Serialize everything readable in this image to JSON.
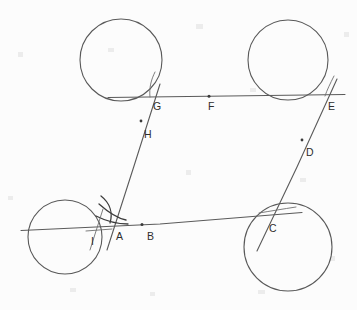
{
  "diagram": {
    "background_color": "#fcfcfc",
    "stroke_color": "#595959",
    "label_color": "#2e2e2e",
    "width": 357,
    "height": 310,
    "circles": [
      {
        "name": "circle-top-left",
        "cx": 121,
        "cy": 60,
        "r": 41
      },
      {
        "name": "circle-top-right",
        "cx": 288,
        "cy": 60,
        "r": 40
      },
      {
        "name": "circle-bottom-left",
        "cx": 65,
        "cy": 237,
        "r": 37
      },
      {
        "name": "circle-bottom-right",
        "cx": 288,
        "cy": 247,
        "r": 44
      }
    ],
    "points": [
      {
        "label": "A",
        "x": 118,
        "y": 235,
        "dot_x": 112,
        "dot_y": 224,
        "has_dot": false
      },
      {
        "label": "B",
        "x": 149,
        "y": 236,
        "dot_x": 142,
        "dot_y": 222,
        "has_dot": true
      },
      {
        "label": "C",
        "x": 272,
        "y": 228,
        "dot_x": 263,
        "dot_y": 212,
        "has_dot": false
      },
      {
        "label": "D",
        "x": 307,
        "y": 152,
        "dot_x": 301,
        "dot_y": 142,
        "has_dot": true
      },
      {
        "label": "E",
        "x": 330,
        "y": 107,
        "dot_x": 325,
        "dot_y": 96,
        "has_dot": false
      },
      {
        "label": "F",
        "x": 211,
        "y": 107,
        "dot_x": 208,
        "dot_y": 96,
        "has_dot": true
      },
      {
        "label": "G",
        "x": 156,
        "y": 108,
        "dot_x": 150,
        "dot_y": 97,
        "has_dot": false
      },
      {
        "label": "H",
        "x": 146,
        "y": 134,
        "dot_x": 142,
        "dot_y": 122,
        "has_dot": true
      },
      {
        "label": "I",
        "x": 93,
        "y": 240,
        "dot_x": 96,
        "dot_y": 228,
        "has_dot": false
      }
    ],
    "segments": [
      {
        "name": "segment-G-F-E",
        "x1": 108,
        "y1": 97,
        "x2": 345,
        "y2": 95
      },
      {
        "name": "segment-A-B-C",
        "x1": 21,
        "y1": 230,
        "x2": 302,
        "y2": 213
      },
      {
        "name": "segment-G-H-A",
        "x1": 159,
        "y1": 85,
        "x2": 108,
        "y2": 250
      },
      {
        "name": "segment-E-D-C",
        "x1": 336,
        "y1": 80,
        "x2": 258,
        "y2": 250
      }
    ]
  }
}
